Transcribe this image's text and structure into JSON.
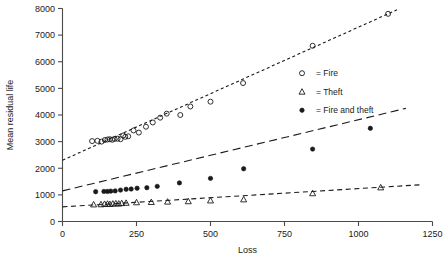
{
  "chart_data": {
    "type": "scatter",
    "title": "",
    "xlabel": "Loss",
    "ylabel": "Mean residual life",
    "xlim": [
      0,
      1250
    ],
    "ylim": [
      0,
      8000
    ],
    "xticks": [
      0,
      250,
      500,
      750,
      1000,
      1250
    ],
    "yticks": [
      0,
      1000,
      2000,
      3000,
      4000,
      5000,
      6000,
      7000,
      8000
    ],
    "xtick_labels": [
      "0",
      "250",
      "500",
      "750",
      "1000",
      "1250"
    ],
    "ytick_labels": [
      "0",
      "1000",
      "2000",
      "3000",
      "4000",
      "5000",
      "6000",
      "7000",
      "8000"
    ],
    "grid": false,
    "legend_position": "center-right",
    "series": [
      {
        "name": "Fire",
        "legend_label": "= Fire",
        "marker": "open-circle",
        "line_style": "dotted",
        "points": [
          {
            "x": 100,
            "y": 3020
          },
          {
            "x": 118,
            "y": 3030
          },
          {
            "x": 132,
            "y": 3000
          },
          {
            "x": 143,
            "y": 3060
          },
          {
            "x": 152,
            "y": 3080
          },
          {
            "x": 160,
            "y": 3090
          },
          {
            "x": 168,
            "y": 3070
          },
          {
            "x": 176,
            "y": 3100
          },
          {
            "x": 186,
            "y": 3110
          },
          {
            "x": 196,
            "y": 3090
          },
          {
            "x": 205,
            "y": 3230
          },
          {
            "x": 212,
            "y": 3180
          },
          {
            "x": 222,
            "y": 3200
          },
          {
            "x": 240,
            "y": 3420
          },
          {
            "x": 258,
            "y": 3340
          },
          {
            "x": 282,
            "y": 3560
          },
          {
            "x": 305,
            "y": 3720
          },
          {
            "x": 330,
            "y": 3900
          },
          {
            "x": 352,
            "y": 4050
          },
          {
            "x": 398,
            "y": 4000
          },
          {
            "x": 432,
            "y": 4320
          },
          {
            "x": 500,
            "y": 4500
          },
          {
            "x": 610,
            "y": 5200
          },
          {
            "x": 845,
            "y": 6600
          },
          {
            "x": 1100,
            "y": 7800
          }
        ],
        "fit_line": {
          "x0": 0,
          "y0": 2300,
          "x1": 1130,
          "y1": 7950
        }
      },
      {
        "name": "Fire and theft",
        "legend_label": "= Fire and theft",
        "marker": "filled-circle",
        "line_style": "long-dash",
        "points": [
          {
            "x": 112,
            "y": 1120
          },
          {
            "x": 140,
            "y": 1130
          },
          {
            "x": 152,
            "y": 1130
          },
          {
            "x": 163,
            "y": 1140
          },
          {
            "x": 178,
            "y": 1150
          },
          {
            "x": 196,
            "y": 1180
          },
          {
            "x": 215,
            "y": 1210
          },
          {
            "x": 232,
            "y": 1220
          },
          {
            "x": 252,
            "y": 1250
          },
          {
            "x": 285,
            "y": 1270
          },
          {
            "x": 320,
            "y": 1320
          },
          {
            "x": 395,
            "y": 1450
          },
          {
            "x": 500,
            "y": 1620
          },
          {
            "x": 612,
            "y": 1980
          },
          {
            "x": 845,
            "y": 2720
          },
          {
            "x": 1040,
            "y": 3500
          }
        ],
        "fit_line": {
          "x0": 0,
          "y0": 1150,
          "x1": 1160,
          "y1": 4250
        }
      },
      {
        "name": "Theft",
        "legend_label": "= Theft",
        "marker": "open-triangle",
        "line_style": "medium-dash",
        "points": [
          {
            "x": 105,
            "y": 640
          },
          {
            "x": 130,
            "y": 645
          },
          {
            "x": 142,
            "y": 660
          },
          {
            "x": 152,
            "y": 665
          },
          {
            "x": 160,
            "y": 655
          },
          {
            "x": 170,
            "y": 670
          },
          {
            "x": 180,
            "y": 680
          },
          {
            "x": 190,
            "y": 672
          },
          {
            "x": 200,
            "y": 690
          },
          {
            "x": 215,
            "y": 700
          },
          {
            "x": 250,
            "y": 720
          },
          {
            "x": 300,
            "y": 730
          },
          {
            "x": 355,
            "y": 745
          },
          {
            "x": 425,
            "y": 760
          },
          {
            "x": 500,
            "y": 790
          },
          {
            "x": 612,
            "y": 830
          },
          {
            "x": 845,
            "y": 1060
          },
          {
            "x": 1075,
            "y": 1280
          }
        ],
        "fit_line": {
          "x0": 0,
          "y0": 550,
          "x1": 1210,
          "y1": 1380
        }
      }
    ]
  },
  "legend": {
    "entries": [
      {
        "label": "= Fire",
        "marker": "open-circle"
      },
      {
        "label": "= Theft",
        "marker": "open-triangle"
      },
      {
        "label": "= Fire and theft",
        "marker": "filled-circle"
      }
    ]
  }
}
